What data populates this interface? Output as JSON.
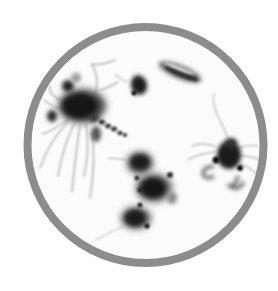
{
  "image": {
    "subject": "plankton-illustration",
    "description": "Grayscale illustration of zooplankton (crab larvae and copepods) inside a circular gray frame",
    "colors": {
      "background": "#ffffff",
      "frame": "#8c8c8c",
      "frame_inner": "#fbfbfb",
      "organism_dark": "#1a1a1a",
      "organism_mid": "#555555",
      "appendage": "#b4b4b4"
    },
    "frame": {
      "cx": 145.5,
      "cy": 145,
      "r": 118,
      "stroke_width": 8
    },
    "organisms": [
      {
        "name": "large-crab-larva",
        "x": 80,
        "y": 108
      },
      {
        "name": "small-blob",
        "x": 138,
        "y": 85
      },
      {
        "name": "elongated-copepod",
        "x": 178,
        "y": 72
      },
      {
        "name": "right-crab-larva",
        "x": 228,
        "y": 158
      },
      {
        "name": "cluster-upper",
        "x": 140,
        "y": 163
      },
      {
        "name": "cluster-middle",
        "x": 153,
        "y": 188
      },
      {
        "name": "cluster-lower",
        "x": 135,
        "y": 218
      }
    ]
  }
}
